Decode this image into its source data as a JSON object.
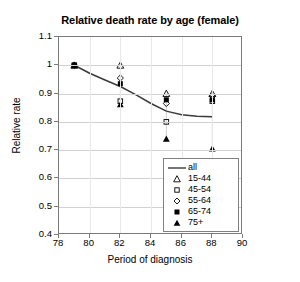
{
  "chart_data": {
    "type": "scatter",
    "title": "Relative death rate by age (female)",
    "xlabel": "Period of diagnosis",
    "ylabel": "Relative rate",
    "xlim": [
      78,
      90
    ],
    "ylim": [
      0.4,
      1.1
    ],
    "xticks": [
      78,
      80,
      82,
      84,
      86,
      88,
      90
    ],
    "yticks": [
      0.4,
      0.5,
      0.6,
      0.7,
      0.8,
      0.9,
      1,
      1.1
    ],
    "ytick_labels": [
      "0.4",
      "0.5",
      "0.6",
      "0.7",
      "0.8",
      "0.9",
      "1",
      "1.1"
    ],
    "xtick_labels": [
      "78",
      "80",
      "82",
      "84",
      "86",
      "88",
      "90"
    ],
    "grid": true,
    "legend_position": "bottom-right",
    "x": [
      79,
      82,
      85,
      88
    ],
    "series": [
      {
        "name": "all",
        "marker": "line",
        "filled": true,
        "values": [
          1.0,
          0.925,
          0.832,
          0.818
        ],
        "line_points": [
          [
            79,
            1.0
          ],
          [
            80,
            0.972
          ],
          [
            81,
            0.948
          ],
          [
            82,
            0.925
          ],
          [
            83,
            0.896
          ],
          [
            84,
            0.865
          ],
          [
            85,
            0.838
          ],
          [
            86,
            0.825
          ],
          [
            87,
            0.82
          ],
          [
            88,
            0.818
          ]
        ]
      },
      {
        "name": "15-44",
        "marker": "triangle-open",
        "filled": false,
        "values": [
          1.0,
          1.0,
          0.9,
          0.9
        ]
      },
      {
        "name": "45-54",
        "marker": "square-open",
        "filled": false,
        "values": [
          1.0,
          0.873,
          0.8,
          0.873
        ]
      },
      {
        "name": "55-64",
        "marker": "diamond-open",
        "filled": false,
        "values": [
          1.0,
          0.955,
          0.865,
          0.89
        ]
      },
      {
        "name": "65-74",
        "marker": "square-filled",
        "filled": true,
        "values": [
          1.0,
          0.935,
          0.878,
          0.878
        ]
      },
      {
        "name": "75+",
        "marker": "triangle-filled",
        "filled": true,
        "values": [
          1.0,
          0.862,
          0.74,
          0.705
        ]
      }
    ],
    "colors": {
      "axis": "#7a7a7a",
      "grid": "#d2d2d2",
      "line": "#3a3a3a",
      "marker": "#000000",
      "background": "#ffffff"
    }
  }
}
